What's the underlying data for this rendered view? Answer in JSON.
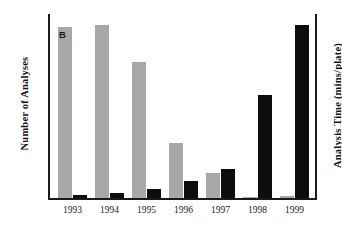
{
  "chart_data": {
    "type": "bar",
    "title": "",
    "subtitle": "",
    "xlabel": "",
    "ylabel": "Number of Analyses",
    "y2label": "Analysis Time (mins/plate)",
    "categories": [
      "1993",
      "1994",
      "1995",
      "1996",
      "1997",
      "1998",
      "1999"
    ],
    "grid": false,
    "legend_position": "in-plot-callout",
    "ylim": [
      0,
      100
    ],
    "y2lim": [
      0,
      100
    ],
    "axis_ticks_visible": false,
    "series": [
      {
        "name": "B",
        "axis": "left",
        "description": "Number of Analyses",
        "color": "#a8a8a8",
        "callout_label": "B",
        "values": [
          92.5,
          94,
          74,
          30,
          13.5,
          0.8,
          1.2
        ]
      },
      {
        "name": "A",
        "axis": "right",
        "description": "Analysis Time (mins/plate)",
        "color": "#0d0d0d",
        "callout_label": "A",
        "values": [
          1.6,
          3.2,
          5,
          9.5,
          16,
          56,
          94
        ]
      }
    ]
  },
  "axes": {
    "left_title": "Number of Analyses",
    "right_title": "Analysis Time (mins/plate)"
  },
  "callouts": {
    "series_b": "B",
    "series_a": "A"
  },
  "colors": {
    "series_b": "#a8a8a8",
    "series_a": "#0d0d0d",
    "axis": "#1a1a1a",
    "background": "#ffffff"
  }
}
